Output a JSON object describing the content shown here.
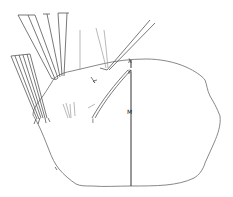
{
  "figure": {
    "type": "scientific line drawing",
    "labels": [
      {
        "id": "label-p",
        "text": "P",
        "x": 128,
        "y": 73
      },
      {
        "id": "label-m",
        "text": "M",
        "x": 127,
        "y": 113
      },
      {
        "id": "label-l",
        "text": "l",
        "x": 92,
        "y": 121
      },
      {
        "id": "label-top",
        "text": "λ",
        "x": 128,
        "y": 63
      },
      {
        "id": "label-e",
        "text": "e",
        "x": 53,
        "y": 169
      }
    ],
    "colors": {
      "outline": "#7a7a7a",
      "setae": "#555555",
      "axis": "#333333",
      "background": "#ffffff"
    }
  }
}
